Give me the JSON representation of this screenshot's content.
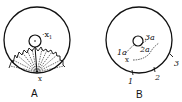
{
  "figures": [
    {
      "id": "A",
      "caption": "A",
      "labels": {
        "inner_point": "x",
        "inner_sub": "1",
        "edge_point": "x"
      }
    },
    {
      "id": "B",
      "caption": "B",
      "labels": {
        "start": "x",
        "path1": "1a",
        "path2": "2a",
        "path3": "3a",
        "tick1": "1",
        "tick2": "2",
        "tick3": "3"
      }
    }
  ],
  "colors": {
    "ink": "#111111",
    "background": "#ffffff"
  }
}
